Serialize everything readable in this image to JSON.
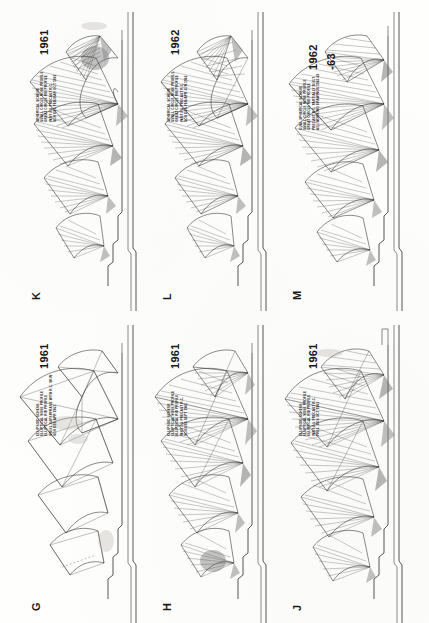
{
  "document": {
    "type": "architectural-drawing-sheet",
    "orientation": "landscape-rotated-90",
    "width": 429,
    "height": 623,
    "background_color": "#fefefd",
    "ink_color": "#2b2b2b"
  },
  "panels": [
    {
      "id": "G",
      "plate_label": "G",
      "year": "1961",
      "year_line2": "",
      "notes": [
        "ELLIPSOID SCHEME",
        "ELLIPTICAL NOSE PROFILE",
        "ELLIPTICAL RIB PROFILE",
        "STEEL SUPERFRAME WITH R.C. SKIN",
        "SCH DES APR 1961"
      ],
      "row": "bottom",
      "column": 0
    },
    {
      "id": "H",
      "plate_label": "H",
      "year": "1961",
      "year_line2": "",
      "notes": [
        "ELLIPSOID SCHEME",
        "ELLIPTICAL NOSE PROFILE",
        "ELLIPTICAL RIB PROFILE",
        "INSITU & PRECAST R.C.",
        "SCH DES SEPT 1961"
      ],
      "row": "bottom",
      "column": 1
    },
    {
      "id": "J",
      "plate_label": "J",
      "year": "1961",
      "year_line2": "",
      "notes": [
        "ELLIPSOID SCHEME",
        "ELLIPTICAL NOSE PROFILE",
        "ELLIPTICAL RIB PROFILE",
        "INSITU & PRECAST R.C.",
        "PREL. DES OCT 1961"
      ],
      "row": "bottom",
      "column": 2
    },
    {
      "id": "K",
      "plate_label": "K",
      "year": "1961",
      "year_line2": "",
      "notes": [
        "SPHERICAL SCHEME",
        "SMALL CIRCLE NOSE PROFILE",
        "GREAT CIRCLE RIB PROFILE",
        "INSITU & PRECAST R.C.",
        "SCH DES FEB/MAR OCT 1961"
      ],
      "row": "top",
      "column": 0
    },
    {
      "id": "L",
      "plate_label": "L",
      "year": "1962",
      "year_line2": "",
      "notes": [
        "SPHERICAL SCHEME",
        "SMALL CIRCLE NOSE PROFILE",
        "GREAT CIRCLE RIB PROFILE",
        "INSITU & PRECAST R.C.",
        "SCH DES FEB/APR JUN 1962"
      ],
      "row": "top",
      "column": 1
    },
    {
      "id": "M",
      "plate_label": "M",
      "year": "1962",
      "year_line2": "-63",
      "notes": [
        "DUAL SPHERICAL SCHEME",
        "SMALL CIRCLE NOSE PROFILE",
        "GREAT CIRCLE RIB PROFILE",
        "PRECAST R.C. PARTIALLY BUILT",
        "ALL WORKING DRAWINGS 1962-63"
      ],
      "row": "top",
      "column": 2
    }
  ]
}
